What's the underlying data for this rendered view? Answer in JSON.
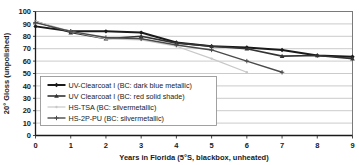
{
  "chart_data": {
    "type": "line",
    "title": "",
    "xlabel": "Years in Florida (5°S, blackbox, unheated)",
    "ylabel": "20° Gloss (unpolished)",
    "xlim": [
      0,
      9
    ],
    "ylim": [
      0,
      100
    ],
    "xticks": [
      "0",
      "1",
      "2",
      "3",
      "4",
      "5",
      "6",
      "7",
      "8",
      "9"
    ],
    "yticks": [
      "0",
      "10",
      "20",
      "30",
      "40",
      "50",
      "60",
      "70",
      "80",
      "90",
      "100"
    ],
    "grid": "horizontal",
    "legend_position": "lower-left-inside",
    "series": [
      {
        "name": "UV-Clearcoat I (BC: dark blue metallic)",
        "color": "#1a1a1a",
        "width": 2.0,
        "marker": "diamond",
        "x": [
          0,
          1,
          2,
          3,
          4,
          5,
          6,
          7,
          8,
          9
        ],
        "values": [
          88,
          84,
          84,
          83,
          75,
          72,
          71,
          69,
          64.5,
          63.5
        ]
      },
      {
        "name": "UV Clearcoat I (BC: red solid shade)",
        "color": "#333333",
        "width": 1.6,
        "marker": "triangle",
        "x": [
          0,
          1,
          2,
          3,
          4,
          5,
          6,
          7,
          8,
          9
        ],
        "values": [
          92,
          83,
          78,
          80,
          74.5,
          72,
          70,
          64,
          64.5,
          62
        ]
      },
      {
        "name": "HS-TSA (BC: silvermetallic)",
        "color": "#c8c8c8",
        "width": 1.2,
        "marker": "dot",
        "x": [
          0,
          1,
          2,
          3,
          4,
          5,
          6
        ],
        "values": [
          92,
          84,
          78,
          77,
          72,
          62,
          51
        ]
      },
      {
        "name": "HS-2P-PU (BC: silvermetallic)",
        "color": "#4a4a4a",
        "width": 1.4,
        "marker": "plus",
        "x": [
          0,
          1,
          2,
          3,
          4,
          5,
          6,
          7
        ],
        "values": [
          91,
          84,
          79,
          78,
          73,
          69,
          60,
          51
        ]
      }
    ]
  },
  "legend": {
    "entries": [
      "UV-Clearcoat I (BC: dark blue metallic)",
      "UV Clearcoat I (BC: red solid shade)",
      "HS-TSA (BC: silvermetallic)",
      "HS-2P-PU (BC: silvermetallic)"
    ]
  }
}
